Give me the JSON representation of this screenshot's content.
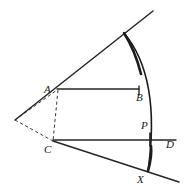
{
  "figure": {
    "kind": "geometry-diagram",
    "title": "",
    "background_color": "#ffffff",
    "stroke_color": "#262626",
    "dashed_stroke_color": "#3a3a3a",
    "label_color": "#1a1a1a",
    "width": 190,
    "height": 194,
    "labels": [
      {
        "id": "A",
        "text": "A",
        "x": 44,
        "y": 84
      },
      {
        "id": "B",
        "text": "B",
        "x": 136,
        "y": 92
      },
      {
        "id": "C",
        "text": "C",
        "x": 44,
        "y": 144
      },
      {
        "id": "P",
        "text": "P",
        "x": 141,
        "y": 120
      },
      {
        "id": "D",
        "text": "D",
        "x": 166,
        "y": 139
      },
      {
        "id": "X",
        "text": "X",
        "x": 137,
        "y": 174
      }
    ],
    "points": {
      "A": {
        "x": 57,
        "y": 90
      },
      "B": {
        "x": 139,
        "y": 89
      },
      "C": {
        "x": 53,
        "y": 141
      },
      "D": {
        "x": 176,
        "y": 140
      },
      "P": {
        "x": 150,
        "y": 139
      },
      "X": {
        "x": 148,
        "y": 171
      },
      "apex": {
        "x": 15,
        "y": 120
      },
      "upper_ray_end": {
        "x": 153,
        "y": 11
      },
      "upper_arc_top": {
        "x": 124,
        "y": 33
      },
      "lower_ray_end": {
        "x": 179,
        "y": 182
      }
    },
    "segments": [
      {
        "name": "upper-ray",
        "d": "M 15 120 L 153 11",
        "width": 1.5,
        "style": "solid"
      },
      {
        "name": "lower-ray",
        "d": "M 53 141 L 179 182",
        "width": 1.5,
        "style": "solid"
      },
      {
        "name": "segment-AB",
        "d": "M 57 89 L 139 89",
        "width": 1.4,
        "style": "solid"
      },
      {
        "name": "tick-at-B",
        "d": "M 139 86 L 139 95",
        "width": 1.4,
        "style": "solid"
      },
      {
        "name": "segment-CD",
        "d": "M 53 140 L 176 140",
        "width": 1.4,
        "style": "solid"
      },
      {
        "name": "tick-at-P",
        "d": "M 150 133 L 150 146",
        "width": 1.6,
        "style": "solid"
      },
      {
        "name": "dashed-apex-to-A",
        "d": "M 15 120 L 57 90",
        "style": "dashed"
      },
      {
        "name": "dashed-apex-to-C",
        "d": "M 15 120 L 53 141",
        "style": "dashed"
      },
      {
        "name": "dashed-A-to-C",
        "d": "M 58 90 L 53 141",
        "style": "dashed"
      }
    ],
    "arcs": [
      {
        "name": "main-arc",
        "d": "M 124 33 C 145 58, 158 100, 148 171",
        "width": 1.6
      },
      {
        "name": "arc-thick-top",
        "d": "M 124 33 C 131 44, 137 58, 141 74",
        "width": 2.6
      },
      {
        "name": "arc-thick-bottom",
        "d": "M 151 146 C 152 155, 150 164, 148 171",
        "width": 2.6
      }
    ]
  }
}
